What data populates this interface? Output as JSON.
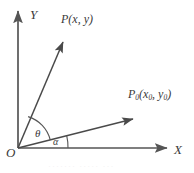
{
  "figure": {
    "background_color": "#ffffff",
    "stroke_color": "#555555",
    "text_color": "#3a3a3a",
    "width": 194,
    "height": 173,
    "axes": {
      "y_label": "Y",
      "x_label": "X",
      "origin_label": "O"
    },
    "vectors": [
      {
        "name": "vector-op",
        "label_full": "P(x, y)",
        "label_base": "P(x, y)",
        "from": [
          18,
          148
        ],
        "to": [
          66,
          37
        ]
      },
      {
        "name": "vector-op0",
        "label_base": "P",
        "label_sub1": "0",
        "label_mid": "(x",
        "label_sub2": "0",
        "label_comma": ", y",
        "label_sub3": "0",
        "label_close": ")",
        "from": [
          18,
          148
        ],
        "to": [
          138,
          118
        ]
      }
    ],
    "angles": [
      {
        "name": "angle-theta",
        "label": "θ",
        "between": [
          "vector-op0",
          "vector-op"
        ]
      },
      {
        "name": "angle-alpha",
        "label": "α",
        "between": [
          "x-axis",
          "vector-op0"
        ]
      }
    ],
    "caption": {
      "text": "·······  ····· ···",
      "visible": "cropped"
    }
  }
}
